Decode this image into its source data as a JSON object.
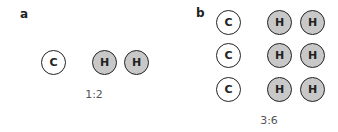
{
  "panels": [
    {
      "label": "a",
      "ratio": "1:2",
      "atoms": [
        {
          "symbol": "C",
          "type": "carbon"
        },
        {
          "symbol": "H",
          "type": "hydrogen"
        },
        {
          "symbol": "H",
          "type": "hydrogen"
        }
      ]
    },
    {
      "label": "b",
      "ratio": "3:6",
      "rows": [
        [
          {
            "symbol": "C"
          },
          {
            "symbol": "H"
          },
          {
            "symbol": "H"
          }
        ],
        [
          {
            "symbol": "C"
          },
          {
            "symbol": "H"
          },
          {
            "symbol": "H"
          }
        ],
        [
          {
            "symbol": "C"
          },
          {
            "symbol": "H"
          },
          {
            "symbol": "H"
          }
        ]
      ]
    }
  ],
  "colors": {
    "hydrogen_fill": "#c8c8c8",
    "carbon_fill": "#ffffff",
    "outline": "#222222"
  }
}
